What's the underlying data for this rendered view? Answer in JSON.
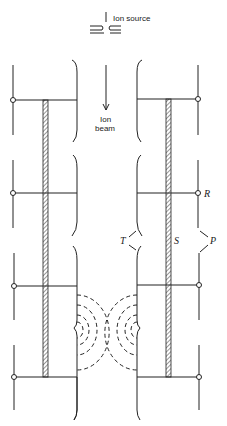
{
  "labels": {
    "ion_source": "Ion source",
    "ion_beam_line1": "Ion",
    "ion_beam_line2": "beam",
    "R": "R",
    "S": "S",
    "T": "T",
    "P": "P"
  },
  "colors": {
    "stroke": "#222222",
    "background": "#ffffff"
  },
  "electrodes": {
    "rows_y": [
      100,
      193,
      286,
      377
    ],
    "left_outer_x": 13,
    "left_bracket_x": 77,
    "right_bracket_x": 137,
    "right_outer_x": 198,
    "left_bar_x": 43,
    "right_bar_x": 166
  }
}
